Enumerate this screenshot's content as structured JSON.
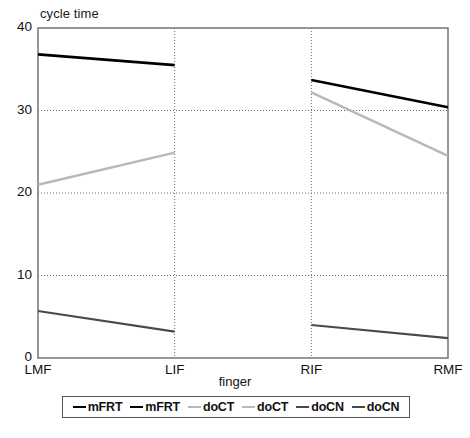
{
  "chart_data": {
    "type": "line",
    "title": "cycle time",
    "xlabel": "finger",
    "ylabel": "",
    "categories": [
      "LMF",
      "LIF",
      "RIF",
      "RMF"
    ],
    "ylim": [
      0,
      40
    ],
    "yticks": [
      0,
      10,
      20,
      30,
      40
    ],
    "ytick_labels": [
      "0",
      "10",
      "20",
      "30",
      "40"
    ],
    "grid": "horizontal-and-vertical-dotted",
    "legend_position": "bottom",
    "series": [
      {
        "name": "mFRT",
        "color": "#000000",
        "width": 2.6,
        "values": [
          36.8,
          35.5,
          null,
          null
        ]
      },
      {
        "name": "mFRT",
        "color": "#000000",
        "width": 2.6,
        "values": [
          null,
          null,
          33.7,
          30.4
        ]
      },
      {
        "name": "doCT",
        "color": "#b8b8b8",
        "width": 2.4,
        "values": [
          21.0,
          24.9,
          null,
          null
        ]
      },
      {
        "name": "doCT",
        "color": "#b8b8b8",
        "width": 2.4,
        "values": [
          null,
          null,
          32.2,
          24.5
        ]
      },
      {
        "name": "doCN",
        "color": "#4a4a4a",
        "width": 2.2,
        "values": [
          5.7,
          3.2,
          null,
          null
        ]
      },
      {
        "name": "doCN",
        "color": "#4a4a4a",
        "width": 2.2,
        "values": [
          null,
          null,
          4.0,
          2.4
        ]
      }
    ],
    "legend": [
      {
        "label": "mFRT",
        "color": "#000000"
      },
      {
        "label": "mFRT",
        "color": "#000000"
      },
      {
        "label": "doCT",
        "color": "#b8b8b8"
      },
      {
        "label": "doCT",
        "color": "#b8b8b8"
      },
      {
        "label": "doCN",
        "color": "#4a4a4a"
      },
      {
        "label": "doCN",
        "color": "#4a4a4a"
      }
    ]
  },
  "colors": {
    "axis": "#6b6b6b",
    "grid": "#6b6b6b",
    "text": "#111111",
    "background": "#ffffff"
  }
}
